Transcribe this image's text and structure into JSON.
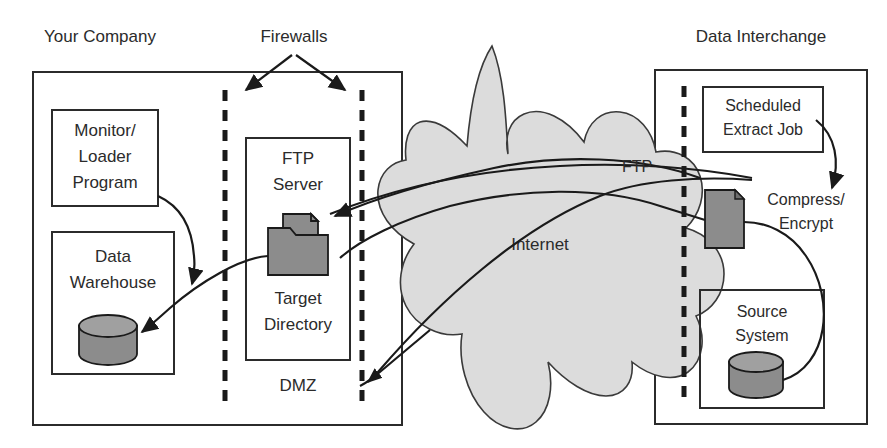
{
  "diagram": {
    "title_labels": {
      "your_company": "Your Company",
      "firewalls": "Firewalls",
      "data_interchange": "Data Interchange"
    },
    "left_zone": {
      "name": "Your Company",
      "nodes": [
        {
          "id": "monitor-loader",
          "lines": [
            "Monitor/",
            "Loader",
            "Program"
          ]
        },
        {
          "id": "data-warehouse",
          "lines": [
            "Data",
            "Warehouse"
          ],
          "icon": "database-cylinder-icon"
        },
        {
          "id": "ftp-server",
          "lines_top": [
            "FTP",
            "Server"
          ],
          "lines_bottom": [
            "Target",
            "Directory"
          ],
          "icon": "folder-document-icon"
        }
      ],
      "dmz_label": "DMZ"
    },
    "center": {
      "cloud_label": "Internet",
      "ftp_label": "FTP"
    },
    "right_zone": {
      "name": "Data Interchange",
      "nodes": [
        {
          "id": "scheduled-extract-job",
          "lines": [
            "Scheduled",
            "Extract Job"
          ]
        },
        {
          "id": "compress-encrypt",
          "lines": [
            "Compress/",
            "Encrypt"
          ],
          "icon": "document-page-icon"
        },
        {
          "id": "source-system",
          "lines": [
            "Source",
            "System"
          ],
          "icon": "database-cylinder-icon"
        }
      ]
    },
    "colors": {
      "stroke": "#2b2b2b",
      "cloud_fill": "#dcdcdc",
      "icon_fill": "#8c8c8c",
      "background": "#ffffff"
    }
  }
}
